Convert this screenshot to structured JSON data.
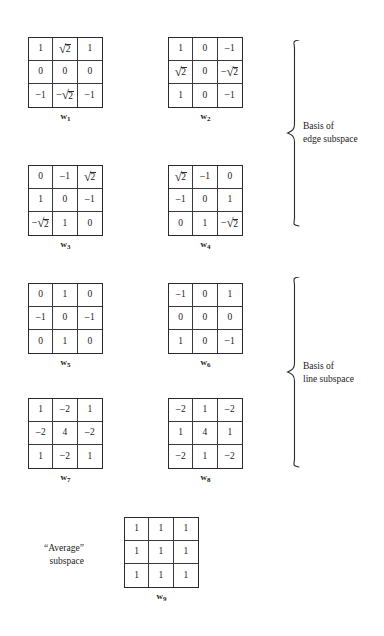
{
  "figure": {
    "matrices": [
      {
        "id": "w1",
        "label": "w",
        "subscript": "1",
        "x": 28,
        "y": 37,
        "rows": [
          [
            "1",
            "sqrt2",
            "1"
          ],
          [
            "0",
            "0",
            "0"
          ],
          [
            "-1",
            "-sqrt2",
            "-1"
          ]
        ]
      },
      {
        "id": "w2",
        "label": "w",
        "subscript": "2",
        "x": 168,
        "y": 37,
        "rows": [
          [
            "1",
            "0",
            "-1"
          ],
          [
            "sqrt2",
            "0",
            "-sqrt2"
          ],
          [
            "1",
            "0",
            "-1"
          ]
        ]
      },
      {
        "id": "w3",
        "label": "w",
        "subscript": "3",
        "x": 28,
        "y": 165,
        "rows": [
          [
            "0",
            "-1",
            "sqrt2"
          ],
          [
            "1",
            "0",
            "-1"
          ],
          [
            "-sqrt2",
            "1",
            "0"
          ]
        ]
      },
      {
        "id": "w4",
        "label": "w",
        "subscript": "4",
        "x": 168,
        "y": 165,
        "rows": [
          [
            "sqrt2",
            "-1",
            "0"
          ],
          [
            "-1",
            "0",
            "1"
          ],
          [
            "0",
            "1",
            "-sqrt2"
          ]
        ]
      },
      {
        "id": "w5",
        "label": "w",
        "subscript": "5",
        "x": 28,
        "y": 283,
        "rows": [
          [
            "0",
            "1",
            "0"
          ],
          [
            "-1",
            "0",
            "-1"
          ],
          [
            "0",
            "1",
            "0"
          ]
        ]
      },
      {
        "id": "w6",
        "label": "w",
        "subscript": "6",
        "x": 168,
        "y": 283,
        "rows": [
          [
            "-1",
            "0",
            "1"
          ],
          [
            "0",
            "0",
            "0"
          ],
          [
            "1",
            "0",
            "-1"
          ]
        ]
      },
      {
        "id": "w7",
        "label": "w",
        "subscript": "7",
        "x": 28,
        "y": 398,
        "rows": [
          [
            "1",
            "-2",
            "1"
          ],
          [
            "-2",
            "4",
            "-2"
          ],
          [
            "1",
            "-2",
            "1"
          ]
        ]
      },
      {
        "id": "w8",
        "label": "w",
        "subscript": "8",
        "x": 168,
        "y": 398,
        "rows": [
          [
            "-2",
            "1",
            "-2"
          ],
          [
            "1",
            "4",
            "1"
          ],
          [
            "-2",
            "1",
            "-2"
          ]
        ]
      },
      {
        "id": "w9",
        "label": "w",
        "subscript": "9",
        "x": 124,
        "y": 517,
        "rows": [
          [
            "1",
            "1",
            "1"
          ],
          [
            "1",
            "1",
            "1"
          ],
          [
            "1",
            "1",
            "1"
          ]
        ]
      }
    ],
    "group_labels": [
      {
        "id": "edge-subspace",
        "text": "Basis of\nedge subspace",
        "x": 303,
        "y": 120,
        "brace": {
          "x": 286,
          "y": 40,
          "height": 186
        }
      },
      {
        "id": "line-subspace",
        "text": "Basis of\nline subspace",
        "x": 303,
        "y": 360,
        "brace": {
          "x": 286,
          "y": 277,
          "height": 190
        }
      }
    ],
    "average_label": {
      "id": "average-subspace",
      "text": "“Average”\nsubspace",
      "x": 44,
      "y": 542
    },
    "colors": {
      "ink": "#1a1a1a",
      "rule": "#2b2b2b",
      "background": "#ffffff"
    }
  }
}
